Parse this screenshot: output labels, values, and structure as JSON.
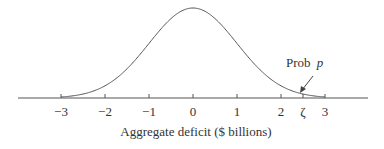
{
  "chart_data": {
    "type": "line",
    "title": "",
    "xlabel": "Aggregate deficit ($ billions)",
    "ylabel": "",
    "xlim": [
      -3.0,
      3.0
    ],
    "curve": "normal density, mean 0, sd ~1",
    "x": [
      -3,
      -2.5,
      -2,
      -1.5,
      -1,
      -0.5,
      0,
      0.5,
      1,
      1.5,
      2,
      2.5,
      3
    ],
    "tick_labels": [
      "−3",
      "−2",
      "−1",
      "0",
      "1",
      "2",
      "ζ",
      "3"
    ],
    "tick_values": [
      -3,
      -2,
      -1,
      0,
      1,
      2,
      2.5,
      3
    ],
    "annotations": [
      {
        "text_prefix": "Prob ",
        "text_var": "p",
        "points_to": "upper tail beyond ζ"
      }
    ],
    "grid": false,
    "legend": null
  },
  "labels": {
    "xlabel": "Aggregate deficit ($ billions)",
    "annot_prefix": "Prob",
    "annot_var": "p"
  },
  "colors": {
    "curve": "#555555",
    "axis": "#555555",
    "text": "#333333"
  }
}
